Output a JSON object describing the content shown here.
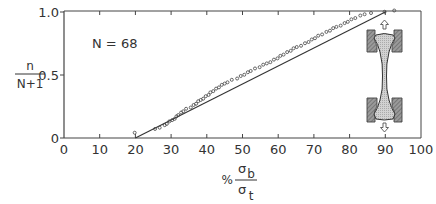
{
  "chart_data": {
    "type": "scatter",
    "title": "",
    "annotation": "N = 68",
    "xlabel": "% σb / σt",
    "xlabel_parts": {
      "prefix": "%",
      "numerator": "σ",
      "numerator_sub": "b",
      "denominator": "σ",
      "denominator_sub": "t"
    },
    "ylabel": "n / (N+1)",
    "ylabel_parts": {
      "numerator": "n",
      "denominator": "N+1"
    },
    "xlim": [
      0,
      100
    ],
    "ylim": [
      0,
      1.0
    ],
    "x_ticks": [
      0,
      10,
      20,
      30,
      40,
      50,
      60,
      70,
      80,
      90,
      100
    ],
    "x_tick_labels": [
      "0",
      "10",
      "20",
      "30",
      "40",
      "50",
      "60",
      "70",
      "80",
      "90",
      "100"
    ],
    "y_ticks": [
      0,
      0.5,
      1.0
    ],
    "y_tick_labels": [
      "0",
      "0.5",
      "1.0"
    ],
    "grid": false,
    "legend": null,
    "fit_line": {
      "x": [
        20,
        90
      ],
      "y": [
        0.0,
        1.0
      ]
    },
    "series": [
      {
        "name": "specimens",
        "marker": "open-circle",
        "x": [
          19.8,
          25.5,
          26.8,
          28.2,
          28.8,
          29.5,
          30.3,
          31.0,
          31.5,
          32.0,
          32.8,
          33.4,
          34.2,
          35.5,
          36.3,
          37.0,
          37.6,
          38.3,
          39.0,
          39.7,
          40.5,
          41.0,
          41.8,
          42.6,
          43.4,
          44.2,
          45.0,
          45.8,
          47.0,
          48.5,
          49.5,
          50.5,
          51.5,
          52.3,
          53.5,
          54.8,
          55.8,
          56.8,
          57.8,
          58.8,
          59.8,
          60.6,
          61.5,
          62.5,
          63.5,
          64.3,
          65.2,
          66.4,
          67.5,
          68.5,
          69.4,
          70.3,
          71.2,
          72.3,
          73.5,
          74.5,
          75.4,
          76.3,
          77.5,
          78.6,
          79.5,
          80.5,
          81.6,
          83.0,
          84.2,
          86.0,
          89.8,
          92.5
        ],
        "y": [
          0.03,
          0.06,
          0.07,
          0.09,
          0.1,
          0.12,
          0.13,
          0.14,
          0.16,
          0.17,
          0.19,
          0.2,
          0.22,
          0.23,
          0.25,
          0.26,
          0.28,
          0.29,
          0.3,
          0.32,
          0.33,
          0.35,
          0.36,
          0.38,
          0.39,
          0.41,
          0.42,
          0.43,
          0.45,
          0.46,
          0.48,
          0.49,
          0.51,
          0.52,
          0.54,
          0.55,
          0.57,
          0.58,
          0.59,
          0.61,
          0.62,
          0.64,
          0.65,
          0.67,
          0.68,
          0.7,
          0.71,
          0.72,
          0.74,
          0.75,
          0.77,
          0.78,
          0.8,
          0.81,
          0.83,
          0.84,
          0.86,
          0.87,
          0.88,
          0.9,
          0.91,
          0.93,
          0.94,
          0.96,
          0.97,
          0.98,
          0.99,
          1.0
        ]
      }
    ],
    "inset": "dog-bone tensile specimen held in grips with arrows indicating pulling up and down"
  }
}
